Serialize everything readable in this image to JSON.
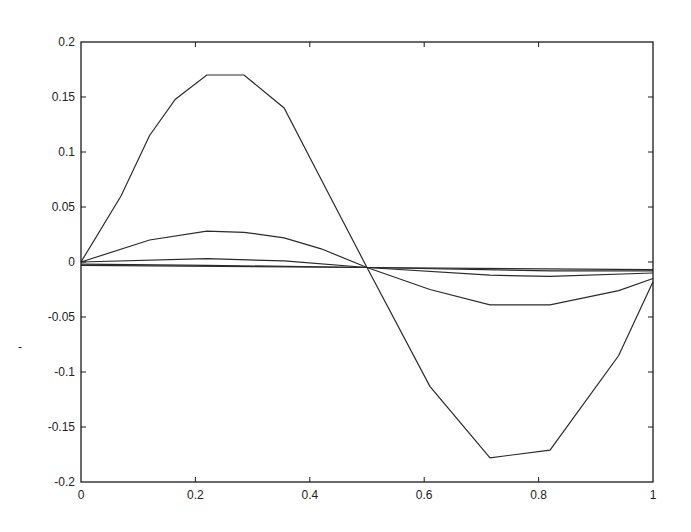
{
  "chart_data": {
    "type": "line",
    "title": "",
    "xlabel": "",
    "ylabel": "",
    "xlim": [
      0,
      1
    ],
    "ylim": [
      -0.2,
      0.2
    ],
    "grid": false,
    "legend": null,
    "x_ticks": [
      "0",
      "0.2",
      "0.4",
      "0.6",
      "0.8",
      "1"
    ],
    "y_ticks": [
      "0.2",
      "0.15",
      "0.1",
      "0.05",
      "0",
      "-0.05",
      "-0.1",
      "-0.15",
      "-0.2"
    ],
    "series": [
      {
        "name": "curve-1",
        "x": [
          0,
          0.07,
          0.12,
          0.165,
          0.22,
          0.285,
          0.355,
          0.42,
          0.5,
          0.61,
          0.715,
          0.82,
          0.94,
          1.0
        ],
        "y": [
          0,
          0.06,
          0.115,
          0.148,
          0.17,
          0.17,
          0.14,
          0.075,
          -0.005,
          -0.113,
          -0.178,
          -0.171,
          -0.085,
          -0.018
        ]
      },
      {
        "name": "curve-2",
        "x": [
          0,
          0.12,
          0.22,
          0.285,
          0.355,
          0.42,
          0.5,
          0.61,
          0.715,
          0.82,
          0.94,
          1.0
        ],
        "y": [
          0,
          0.02,
          0.028,
          0.027,
          0.022,
          0.012,
          -0.005,
          -0.025,
          -0.039,
          -0.039,
          -0.026,
          -0.015
        ]
      },
      {
        "name": "curve-3",
        "x": [
          0,
          0.22,
          0.355,
          0.5,
          0.715,
          0.82,
          1.0
        ],
        "y": [
          0.0,
          0.003,
          0.001,
          -0.005,
          -0.012,
          -0.013,
          -0.01
        ]
      },
      {
        "name": "curve-4",
        "x": [
          0,
          0.22,
          0.5,
          0.82,
          1.0
        ],
        "y": [
          -0.002,
          -0.003,
          -0.005,
          -0.008,
          -0.008
        ]
      },
      {
        "name": "curve-5",
        "x": [
          0,
          0.5,
          1.0
        ],
        "y": [
          -0.003,
          -0.005,
          -0.007
        ]
      }
    ]
  },
  "colors": {
    "line": "#2a2a2a",
    "frame": "#1a1a1a",
    "background": "#ffffff"
  }
}
